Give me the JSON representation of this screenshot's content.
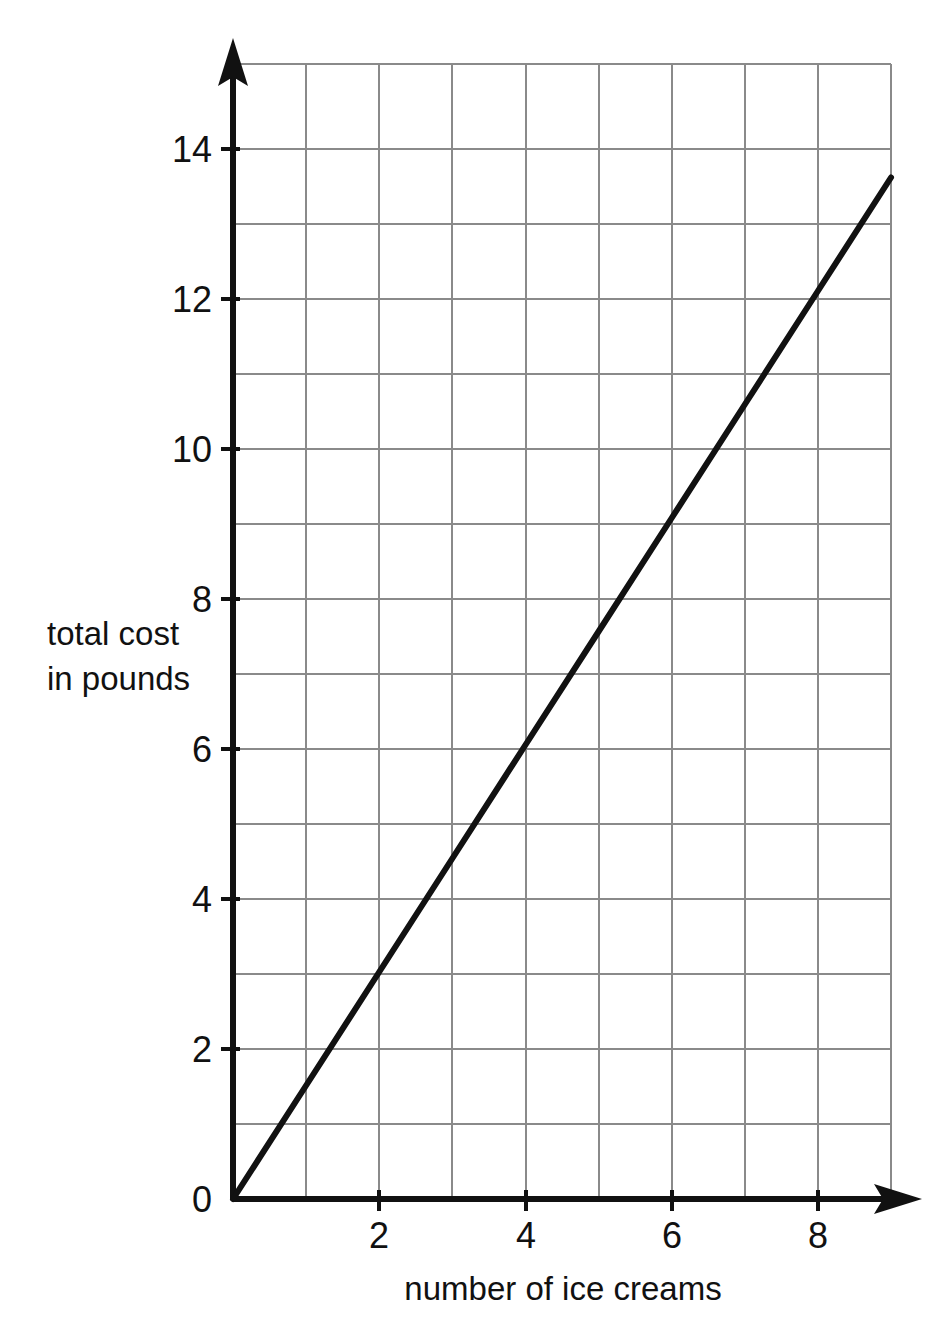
{
  "figure": {
    "background_color": "#ffffff",
    "ink_color": "#111111",
    "grid_color": "#8a8a8a"
  },
  "chart_data": {
    "type": "line",
    "title": "",
    "subtitle": "",
    "xlabel": "number of ice creams",
    "ylabel": "total cost\nin pounds",
    "ylabel_line1": "total cost",
    "ylabel_line2": "in pounds",
    "xlim": [
      0,
      9
    ],
    "ylim": [
      0,
      15
    ],
    "grid": true,
    "grid_x_step": 1,
    "grid_y_step": 1,
    "legend": "none",
    "x_tick_labels": [
      "0",
      "2",
      "4",
      "6",
      "8"
    ],
    "x_tick_values": [
      0,
      2,
      4,
      6,
      8
    ],
    "y_tick_labels": [
      "0",
      "2",
      "4",
      "6",
      "8",
      "10",
      "12",
      "14"
    ],
    "y_tick_values": [
      0,
      2,
      4,
      6,
      8,
      10,
      12,
      14
    ],
    "origin_label": "0",
    "series": [
      {
        "name": "total cost",
        "x": [
          0,
          1,
          2,
          3,
          4,
          5,
          6,
          7,
          8,
          9
        ],
        "values": [
          0,
          1.5,
          3,
          4.5,
          6,
          7.5,
          9,
          10.5,
          12,
          13.5
        ],
        "slope": 1.5,
        "intercept": 0,
        "color": "#111111"
      }
    ],
    "annotations": []
  }
}
